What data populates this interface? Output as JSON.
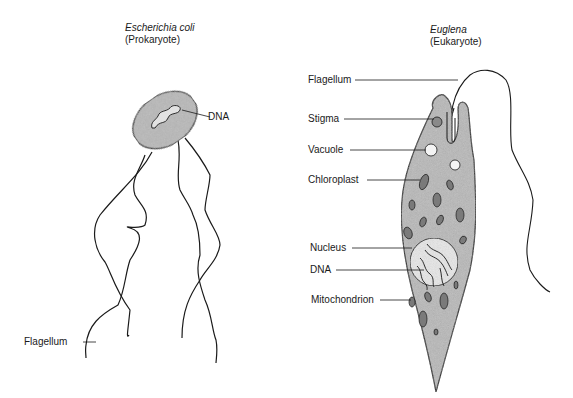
{
  "diagram": {
    "type": "comparison",
    "panels": [
      {
        "organism": "Escherichia coli",
        "classification": "(Prokaryote)",
        "labels": [
          "DNA",
          "Flagellum"
        ]
      },
      {
        "organism": "Euglena",
        "classification": "(Eukaryote)",
        "labels": [
          "Flagellum",
          "Stigma",
          "Vacuole",
          "Chloroplast",
          "Nucleus",
          "DNA",
          "Mitochondrion"
        ]
      }
    ],
    "colors": {
      "ink": "#1a1a1a",
      "cell_fill": "#b8b8b8",
      "organelle_fill": "#7a7a7a",
      "nucleus_fill": "#e8e8e8",
      "vacuole_fill": "#f4f4f4"
    }
  }
}
